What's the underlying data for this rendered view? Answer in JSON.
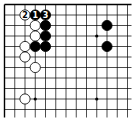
{
  "board": {
    "origin_x": 4.5,
    "origin_y": 4.5,
    "spacing_x": 10.25,
    "spacing_y": 10.5,
    "cols": 13,
    "rows": 11,
    "line_extend_right": 4,
    "line_extend_bottom": 8,
    "edges": {
      "top": true,
      "left": true,
      "right": false,
      "bottom": false
    },
    "line_color": "#000000",
    "background": "#ffffff"
  },
  "star_points": [
    {
      "col": 3,
      "row": 3
    },
    {
      "col": 9,
      "row": 3
    },
    {
      "col": 3,
      "row": 9
    },
    {
      "col": 9,
      "row": 9
    }
  ],
  "stones": [
    {
      "color": "white",
      "col": 2,
      "row": 1,
      "label": "2"
    },
    {
      "color": "black",
      "col": 3,
      "row": 1,
      "label": "1"
    },
    {
      "color": "black",
      "col": 4,
      "row": 1,
      "label": "3"
    },
    {
      "color": "white",
      "col": 3,
      "row": 2,
      "label": ""
    },
    {
      "color": "black",
      "col": 4,
      "row": 2,
      "label": ""
    },
    {
      "color": "white",
      "col": 3,
      "row": 3,
      "label": ""
    },
    {
      "color": "black",
      "col": 4,
      "row": 3,
      "label": ""
    },
    {
      "color": "white",
      "col": 2,
      "row": 4,
      "label": ""
    },
    {
      "color": "black",
      "col": 3,
      "row": 4,
      "label": ""
    },
    {
      "color": "black",
      "col": 4,
      "row": 4,
      "label": ""
    },
    {
      "color": "white",
      "col": 2,
      "row": 5,
      "label": ""
    },
    {
      "color": "white",
      "col": 3,
      "row": 6,
      "label": ""
    },
    {
      "color": "black",
      "col": 10,
      "row": 2,
      "label": ""
    },
    {
      "color": "black",
      "col": 10,
      "row": 4,
      "label": ""
    },
    {
      "color": "white",
      "col": 2,
      "row": 9,
      "label": ""
    }
  ]
}
